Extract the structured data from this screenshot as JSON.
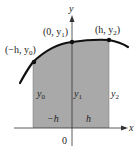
{
  "diagram": {
    "colors": {
      "shade": "#a9a9a9",
      "curve": "#111111",
      "axis": "#333333",
      "text": "#222222"
    },
    "axes": {
      "x_label": "x",
      "y_label": "y",
      "origin_label": "0"
    },
    "points": [
      {
        "label": "(−h, y0)",
        "text_main": "(−h, y",
        "sub": "0",
        "close": ")"
      },
      {
        "label": "(0, y1)",
        "text_main": "(0, y",
        "sub": "1",
        "close": ")"
      },
      {
        "label": "(h, y2)",
        "text_main": "(h, y",
        "sub": "2",
        "close": ")"
      }
    ],
    "ordinates": [
      {
        "main": "y",
        "sub": "0"
      },
      {
        "main": "y",
        "sub": "1"
      },
      {
        "main": "y",
        "sub": "2"
      }
    ],
    "widths": [
      {
        "label": "−h"
      },
      {
        "label": "h"
      }
    ]
  }
}
